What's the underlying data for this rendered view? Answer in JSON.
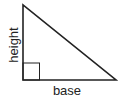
{
  "diagram": {
    "type": "right-triangle",
    "labels": {
      "height": "height",
      "base": "base"
    },
    "colors": {
      "stroke": "#222222",
      "background": "#ffffff"
    },
    "right_angle_marker": true
  }
}
